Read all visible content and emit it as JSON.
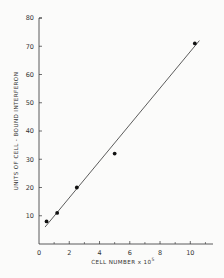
{
  "chart_data": {
    "type": "scatter",
    "title": "",
    "xlabel": "CELL NUMBER x 10",
    "xlabel_superscript": "5",
    "ylabel": "UNITS OF CELL - BOUND INTERFERON",
    "xlim": [
      0,
      11.5
    ],
    "ylim": [
      0,
      80
    ],
    "x_ticks": [
      0,
      2,
      4,
      6,
      8,
      10
    ],
    "x_tick_labels": [
      "0",
      "2",
      "4",
      "6",
      "8",
      "10"
    ],
    "x_minor_ticks": [
      1,
      3,
      5,
      7,
      9,
      11
    ],
    "y_ticks": [
      0,
      10,
      20,
      30,
      40,
      50,
      60,
      70,
      80
    ],
    "y_tick_labels": [
      "",
      "10",
      "20",
      "30",
      "40",
      "50",
      "60",
      "70",
      "80"
    ],
    "grid": false,
    "legend": null,
    "series": [
      {
        "name": "measured",
        "kind": "points",
        "x": [
          0.5,
          1.2,
          2.5,
          5.0,
          10.3
        ],
        "y": [
          8,
          11,
          20,
          32,
          71
        ]
      },
      {
        "name": "fit",
        "kind": "line",
        "x": [
          0.4,
          10.6
        ],
        "y": [
          6,
          72
        ]
      }
    ],
    "colors": {
      "ink": "#333333",
      "background": "#fbfbfa"
    }
  }
}
